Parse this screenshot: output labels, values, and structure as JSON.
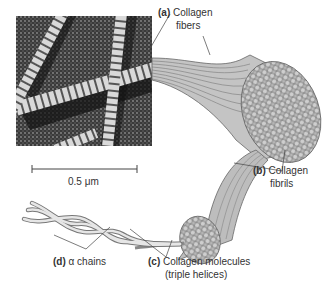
{
  "figure": {
    "type": "diagram",
    "micrograph": {
      "description": "electron micrograph of banded collagen fibrils",
      "scale_bar_label": "0.5 μm"
    },
    "labels": {
      "a": {
        "letter": "(a)",
        "line1": "Collagen",
        "line2": "fibers"
      },
      "b": {
        "letter": "(b)",
        "line1": "Collagen",
        "line2": "fibrils"
      },
      "c": {
        "letter": "(c)",
        "line1": "Collagen molecules",
        "line2": "(triple helices)"
      },
      "d": {
        "letter": "(d)",
        "line1": "α chains"
      }
    },
    "colors": {
      "background": "#ffffff",
      "text": "#333333",
      "micrograph_dark": "#2a2a2a",
      "micrograph_light": "#d8d8d8",
      "fiber_fill": "#b8b8b8",
      "fiber_line": "#555555"
    }
  }
}
